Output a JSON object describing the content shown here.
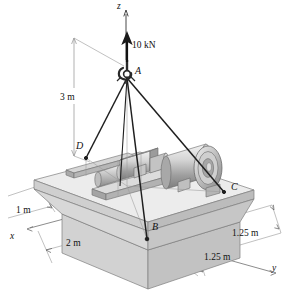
{
  "figure": {
    "type": "engineering-statics-diagram",
    "background": "#ffffff"
  },
  "axes": [
    {
      "name": "z",
      "label": "z",
      "x": 118,
      "y": 2
    },
    {
      "name": "x",
      "label": "x",
      "x": 10,
      "y": 234
    },
    {
      "name": "y",
      "label": "y",
      "x": 272,
      "y": 265
    }
  ],
  "force": {
    "label": "10 kN",
    "x": 130,
    "y": 42,
    "direction": "up"
  },
  "points": [
    {
      "id": "A",
      "label": "A",
      "lx": 135,
      "ly": 67,
      "px": 127,
      "py": 76
    },
    {
      "id": "B",
      "label": "B",
      "lx": 152,
      "ly": 224,
      "px": 147,
      "py": 239
    },
    {
      "id": "C",
      "label": "C",
      "lx": 231,
      "ly": 183,
      "px": 224,
      "py": 192
    },
    {
      "id": "D",
      "label": "D",
      "lx": 77,
      "ly": 143,
      "px": 86,
      "py": 158
    }
  ],
  "dimensions": [
    {
      "id": "height-3m",
      "label": "3 m",
      "x": 62,
      "y": 94
    },
    {
      "id": "base-1m",
      "label": "1 m",
      "x": 18,
      "y": 208
    },
    {
      "id": "base-2m",
      "label": "2 m",
      "x": 70,
      "y": 240
    },
    {
      "id": "right-1p25m",
      "label": "1.25 m",
      "x": 238,
      "y": 230
    },
    {
      "id": "front-1p25m",
      "label": "1.25 m",
      "x": 208,
      "y": 254
    }
  ],
  "colors": {
    "line": "#1a1a1a",
    "cable": "#262626",
    "dim_line": "#8a8a8a",
    "slab_top": "#e8e8e8",
    "slab_front": "#c9c9c9",
    "slab_side": "#b4b4b4",
    "base_front": "#cfcfcf",
    "base_side": "#b9b9b9",
    "base_top": "#dedede",
    "metal_light": "#dcdcdc",
    "metal_mid": "#b0b0b0",
    "metal_dark": "#8f8f8f"
  }
}
